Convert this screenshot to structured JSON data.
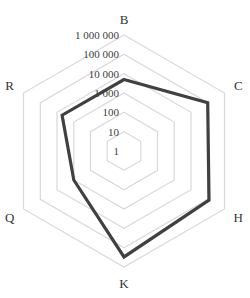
{
  "chart_data": {
    "type": "radar",
    "title": "",
    "scale": "log",
    "categories": [
      "B",
      "C",
      "H",
      "K",
      "Q",
      "R"
    ],
    "series": [
      {
        "name": "Series 1",
        "values": [
          5000,
          100000,
          120000,
          300000,
          1000,
          5000
        ]
      }
    ],
    "tick_labels": [
      "1",
      "10",
      "100",
      "1 000",
      "10 000",
      "100 000",
      "1 000 000"
    ],
    "range": [
      1,
      1000000
    ],
    "grid": true,
    "legend": "none"
  },
  "style": {
    "line_color": "#404040",
    "grid_color": "#d9d9d9",
    "text_color": "#333333"
  }
}
